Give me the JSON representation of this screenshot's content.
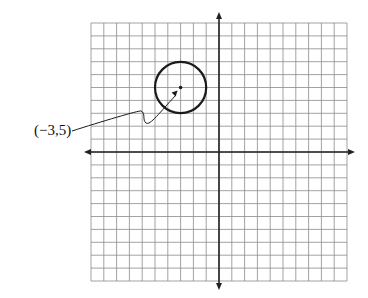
{
  "graph": {
    "x_range": [
      -10,
      10
    ],
    "y_range": [
      -10,
      10
    ],
    "grid_step": 1
  },
  "circle": {
    "center": [
      -3,
      5
    ],
    "radius": 2
  },
  "annotation": {
    "label": "(−3,5)"
  },
  "colors": {
    "grid": "#8a8a8a",
    "axis": "#222222",
    "ink": "#1a1a1a"
  }
}
